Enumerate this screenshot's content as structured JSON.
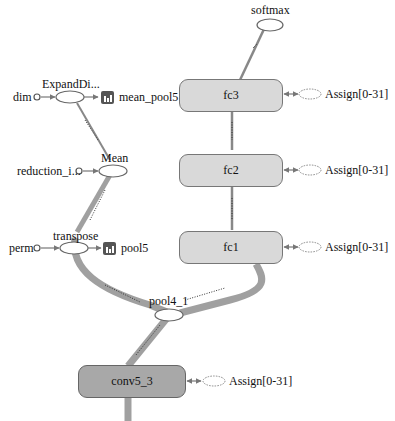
{
  "graph": {
    "nodes": {
      "softmax": {
        "label": "softmax"
      },
      "fc3": {
        "label": "fc3"
      },
      "fc2": {
        "label": "fc2"
      },
      "fc1": {
        "label": "fc1"
      },
      "conv5_3": {
        "label": "conv5_3"
      },
      "pool4_1": {
        "label": "pool4_1"
      },
      "transpose": {
        "label": "transpose"
      },
      "mean": {
        "label": "Mean"
      },
      "expand_dims": {
        "label": "ExpandDi..."
      },
      "dim": {
        "label": "dim"
      },
      "reduction_indices": {
        "label": "reduction_i..."
      },
      "perm": {
        "label": "perm"
      },
      "mean_pool5": {
        "label": "mean_pool5"
      },
      "pool5": {
        "label": "pool5"
      }
    },
    "assign_labels": {
      "fc3": "Assign[0-31]",
      "fc2": "Assign[0-31]",
      "fc1": "Assign[0-31]",
      "conv5_3": "Assign[0-31]"
    },
    "edge_labels": {
      "fc3_softmax": "2×4096",
      "fc2_fc3": "?×4096",
      "fc1_fc2": "?×4096",
      "pool4_transpose": "2×7×7×512",
      "pool4_fc1": "2×7×7×512",
      "conv_pool4": "2×14×14×512",
      "transpose_mean": "?×512×7×7",
      "mean_expand": "?×512"
    },
    "colors": {
      "fc_fill": "#d9d9d9",
      "conv_fill": "#a8a8a8",
      "edge": "#9a9a9a",
      "edge_thick": "#a0a0a0",
      "summary_icon": "#555555"
    }
  }
}
